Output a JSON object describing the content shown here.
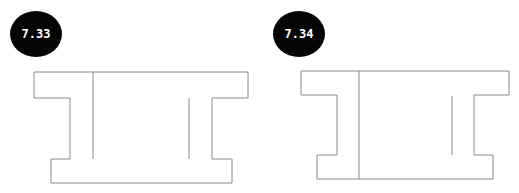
{
  "figures": [
    {
      "label": "7.33",
      "badge": {
        "cx": 36,
        "cy": 34,
        "rx": 26,
        "ry": 23,
        "fill": "#050505"
      },
      "outline_points": "34,72 248,72 248,98 212,98 212,159 232,159 232,183 51,183 51,159 70,159 70,98 34,98 34,72",
      "inner_lines": [
        {
          "x1": 93,
          "y1": 72,
          "x2": 93,
          "y2": 159
        },
        {
          "x1": 189,
          "y1": 98,
          "x2": 189,
          "y2": 159
        }
      ]
    },
    {
      "label": "7.34",
      "badge": {
        "cx": 299,
        "cy": 34,
        "rx": 26,
        "ry": 23,
        "fill": "#050505"
      },
      "outline_points": "301,71 509,71 509,95 474,95 474,155 493,155 493,179 317,179 317,155 337,155 337,95 301,95 301,71",
      "inner_lines": [
        {
          "x1": 359,
          "y1": 71,
          "x2": 359,
          "y2": 179
        },
        {
          "x1": 452,
          "y1": 96,
          "x2": 452,
          "y2": 155
        }
      ]
    }
  ],
  "colors": {
    "stroke": "#8a8a8a",
    "badge": "#050505",
    "badge_text": "#ffffff",
    "background": "#ffffff"
  }
}
